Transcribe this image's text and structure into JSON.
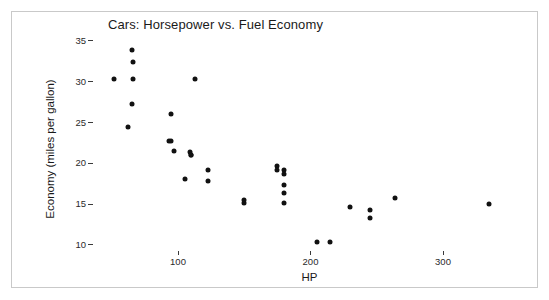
{
  "chart_data": {
    "type": "scatter",
    "title": "Cars: Horsepower vs. Fuel Economy",
    "xlabel": "HP",
    "ylabel": "Economy (miles per gallon)",
    "xlim": [
      40,
      360
    ],
    "ylim": [
      8.5,
      36
    ],
    "grid": false,
    "legend": "none",
    "xticks": [
      100,
      200,
      300
    ],
    "yticks": [
      10,
      15,
      20,
      25,
      30,
      35
    ],
    "xtick_labels": [
      "100",
      "200",
      "300"
    ],
    "ytick_labels": [
      "10",
      "15",
      "20",
      "25",
      "30",
      "35"
    ],
    "marker": "filled-circle",
    "marker_color": "#111111",
    "points": [
      {
        "x": 66,
        "y": 30.4
      },
      {
        "x": 52,
        "y": 30.4
      },
      {
        "x": 65,
        "y": 33.9
      },
      {
        "x": 66,
        "y": 32.4
      },
      {
        "x": 65,
        "y": 27.3
      },
      {
        "x": 62,
        "y": 24.4
      },
      {
        "x": 95,
        "y": 26.0
      },
      {
        "x": 93,
        "y": 22.8
      },
      {
        "x": 95,
        "y": 22.8
      },
      {
        "x": 97,
        "y": 21.5
      },
      {
        "x": 109,
        "y": 21.4
      },
      {
        "x": 110,
        "y": 21.0
      },
      {
        "x": 110,
        "y": 21.0
      },
      {
        "x": 113,
        "y": 30.4
      },
      {
        "x": 105,
        "y": 18.1
      },
      {
        "x": 123,
        "y": 19.2
      },
      {
        "x": 123,
        "y": 17.8
      },
      {
        "x": 150,
        "y": 15.2
      },
      {
        "x": 150,
        "y": 15.5
      },
      {
        "x": 175,
        "y": 19.7
      },
      {
        "x": 175,
        "y": 19.2
      },
      {
        "x": 180,
        "y": 18.7
      },
      {
        "x": 180,
        "y": 19.2
      },
      {
        "x": 180,
        "y": 17.3
      },
      {
        "x": 180,
        "y": 16.4
      },
      {
        "x": 180,
        "y": 15.2
      },
      {
        "x": 205,
        "y": 10.4
      },
      {
        "x": 215,
        "y": 10.4
      },
      {
        "x": 230,
        "y": 14.7
      },
      {
        "x": 245,
        "y": 14.3
      },
      {
        "x": 245,
        "y": 13.3
      },
      {
        "x": 264,
        "y": 15.8
      },
      {
        "x": 335,
        "y": 15.0
      }
    ]
  },
  "axis": {
    "x_tick_positions_px": [
      178,
      311,
      443
    ],
    "y_tick_positions_px": [
      245,
      204.2,
      163.4,
      122.6,
      81.8,
      41
    ]
  }
}
